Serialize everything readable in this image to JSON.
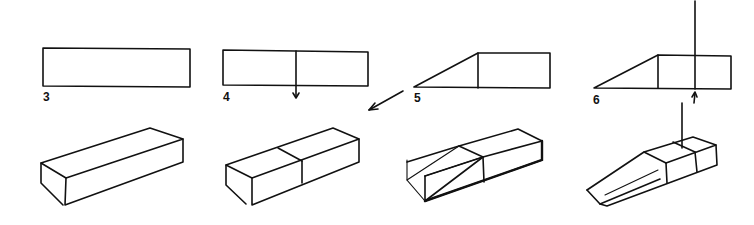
{
  "diagram": {
    "colors": {
      "ink": "#111111",
      "background": "#ffffff"
    },
    "steps": [
      {
        "label": "3",
        "elevation": "plain rectangle",
        "solid": "rectangular block"
      },
      {
        "label": "4",
        "elevation": "rectangle divided in half by vertical line with down arrow",
        "solid": "block divided in two halves"
      },
      {
        "label": "5",
        "elevation": "rectangle with sloped triangle added on left",
        "solid": "block with diagonal construction lines for wedge"
      },
      {
        "label": "6",
        "elevation": "wedge plus rectangle divided by vertical line with up arrow",
        "solid": "ramp-shaped block with vertical projection line"
      }
    ],
    "connectors": [
      {
        "name": "arrow-4-to-5",
        "direction": "down-left"
      }
    ]
  }
}
